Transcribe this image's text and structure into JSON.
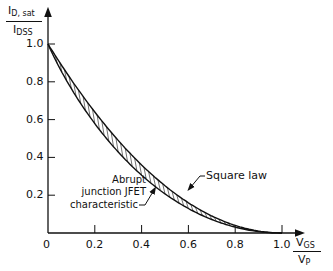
{
  "chart_data": {
    "type": "line",
    "title": "",
    "xlabel": "V_GS / V_P",
    "ylabel": "I_D, sat / I_DSS",
    "xlim": [
      0,
      1.0
    ],
    "ylim": [
      0,
      1.0
    ],
    "x_ticks": [
      "0",
      "0.2",
      "0.4",
      "0.6",
      "0.8",
      "1.0"
    ],
    "y_ticks": [
      "0.2",
      "0.4",
      "0.6",
      "0.8",
      "1.0"
    ],
    "grid": false,
    "x": [
      0,
      0.1,
      0.2,
      0.3,
      0.4,
      0.5,
      0.6,
      0.7,
      0.8,
      0.9,
      1.0
    ],
    "series": [
      {
        "name": "Square law",
        "values": [
          1.0,
          0.81,
          0.64,
          0.49,
          0.36,
          0.25,
          0.16,
          0.09,
          0.04,
          0.01,
          0.0
        ]
      },
      {
        "name": "Abrupt junction JFET characteristic",
        "values": [
          1.0,
          0.763,
          0.579,
          0.429,
          0.306,
          0.207,
          0.129,
          0.071,
          0.031,
          0.008,
          0.0
        ]
      }
    ],
    "annotations": [
      "Square law",
      "Abrupt junction JFET characteristic"
    ]
  },
  "labels": {
    "y_num_main": "I",
    "y_num_sub": "D, sat",
    "y_den_main": "I",
    "y_den_sub": "DSS",
    "x_num_main": "V",
    "x_num_sub": "GS",
    "x_den_main": "V",
    "x_den_sub": "P",
    "square_law": "Square law",
    "abrupt_1": "Abrupt",
    "abrupt_2": "junction JFET",
    "abrupt_3": "characteristic",
    "origin": "0"
  }
}
